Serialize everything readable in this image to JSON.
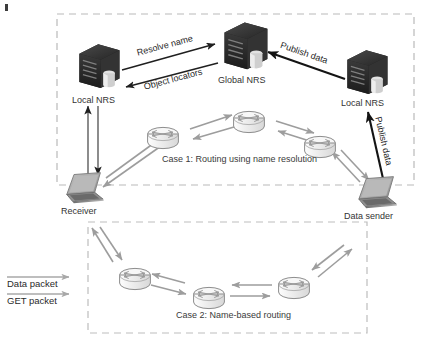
{
  "figure": {
    "background_color": "#ffffff"
  },
  "cases": [
    {
      "id": "case-1",
      "label": "Case 1: Routing using name resolution",
      "box": {
        "x": 57,
        "y": 14,
        "w": 357,
        "h": 171
      }
    },
    {
      "id": "case-2",
      "label": "Case 2: Name-based routing",
      "box": {
        "x": 88,
        "y": 222,
        "w": 279,
        "h": 111
      }
    }
  ],
  "nodes": {
    "local_nrs_left": {
      "label": "Local NRS",
      "icon": "server-icon"
    },
    "global_nrs": {
      "label": "Global NRS",
      "icon": "server-icon"
    },
    "local_nrs_right": {
      "label": "Local NRS",
      "icon": "server-icon"
    },
    "receiver": {
      "label": "Receiver",
      "icon": "laptop-icon"
    },
    "data_sender": {
      "label": "Data sender",
      "icon": "laptop-icon"
    }
  },
  "routers": {
    "icon": "router-icon",
    "case1_count": 3,
    "case2_count": 3
  },
  "arrow_labels": {
    "resolve_name": "Resolve name",
    "object_locators": "Object locators",
    "publish_data_top": "Publish data",
    "publish_data_side": "Publish data"
  },
  "legend": {
    "items": [
      {
        "label": "Data packet",
        "arrow": "right-arrow-icon"
      },
      {
        "label": "GET packet",
        "arrow": "right-arrow-icon"
      }
    ]
  },
  "colors": {
    "server_dark": "#2a2a2a",
    "router_stroke": "#8d8d8d",
    "router_fill": "#f2f2f2",
    "laptop_gray": "#9a9a9a",
    "arrow_gray": "#9d9d9d",
    "arrow_black": "#1a1a1a",
    "dashed_border": "#b9b9b9",
    "text": "#2b2b2b"
  }
}
